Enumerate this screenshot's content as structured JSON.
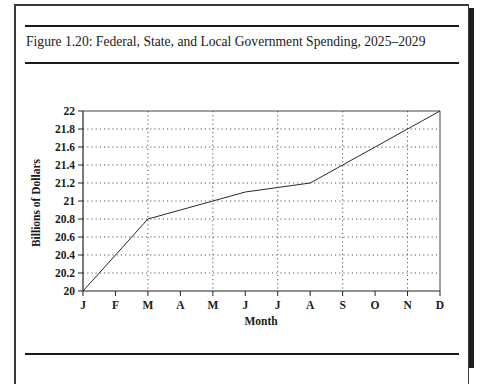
{
  "figure": {
    "caption": "Figure 1.20: Federal, State, and Local Government Spending, 2025–2029"
  },
  "chart_data": {
    "type": "line",
    "title": "Figure 1.20: Federal, State, and Local Government Spending, 2025–2029",
    "xlabel": "Month",
    "ylabel": "Billions of Dollars",
    "categories": [
      "J",
      "F",
      "M",
      "A",
      "M",
      "J",
      "J",
      "A",
      "S",
      "O",
      "N",
      "D"
    ],
    "series": [
      {
        "name": "Spending",
        "values": [
          20.0,
          20.4,
          20.8,
          20.9,
          21.0,
          21.1,
          21.15,
          21.2,
          21.4,
          21.6,
          21.8,
          22.0
        ]
      }
    ],
    "ylim": [
      20,
      22
    ],
    "yticks": [
      "20",
      "20.2",
      "20.4",
      "20.6",
      "20.8",
      "21",
      "21.2",
      "21.4",
      "21.6",
      "21.8",
      "22"
    ],
    "grid": true,
    "grid_style": "dotted",
    "vertical_grid_at": [
      "M",
      "M",
      "J",
      "S",
      "N"
    ],
    "legend": null
  }
}
